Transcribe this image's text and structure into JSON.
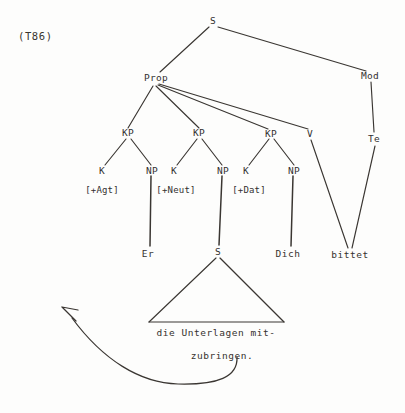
{
  "figure": {
    "example_tag": "(T86)",
    "type": "syntax-tree-diagram"
  },
  "colors": {
    "ink": "#333030",
    "background": "#fdfdfc",
    "line": "#3a3632"
  },
  "nodes": {
    "root_s": "S",
    "prop": "Prop",
    "mod": "Mod",
    "te": "Te",
    "kp1": "KP",
    "kp2": "KP",
    "kp3": "KP",
    "v": "V",
    "k1": "K",
    "np1": "NP",
    "k2": "K",
    "np2": "NP",
    "k3": "K",
    "np3": "NP",
    "embedded_s": "S"
  },
  "features": {
    "agt": "[+Agt]",
    "neut": "[+Neut]",
    "dat": "[+Dat]"
  },
  "terminals": {
    "er": "Er",
    "dich": "Dich",
    "bittet": "bittet"
  },
  "embedded_clause": {
    "line1": "die Unterlagen mit-",
    "line2": "zubringen."
  },
  "annotation": {
    "movement_arrow": "curved-movement-arrow"
  }
}
